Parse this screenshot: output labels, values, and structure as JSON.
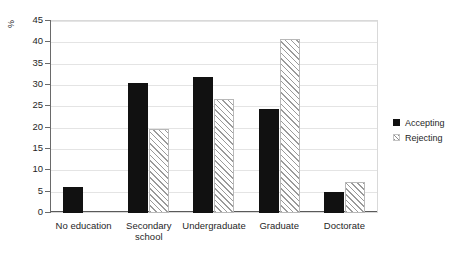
{
  "chart_data": {
    "type": "bar",
    "title": "",
    "subtitle": "",
    "xlabel": "",
    "ylabel": "%",
    "ylim": [
      0,
      45
    ],
    "ytick_step": 5,
    "yticks": [
      0,
      5,
      10,
      15,
      20,
      25,
      30,
      35,
      40,
      45
    ],
    "ytick_labels": [
      "0",
      "5",
      "10",
      "15",
      "20",
      "25",
      "30",
      "35",
      "40",
      "45"
    ],
    "grid": true,
    "grid_axis": "y",
    "legend_position": "right",
    "categories": [
      "No education",
      "Secondary school",
      "Undergraduate",
      "Graduate",
      "Doctorate"
    ],
    "category_label_lines": [
      [
        "No education"
      ],
      [
        "Secondary",
        "school"
      ],
      [
        "Undergraduate"
      ],
      [
        "Graduate"
      ],
      [
        "Doctorate"
      ]
    ],
    "series": [
      {
        "name": "Accepting",
        "fill": "solid",
        "color": "#111111",
        "values": [
          6.2,
          30.5,
          31.8,
          24.5,
          4.9
        ]
      },
      {
        "name": "Rejecting",
        "fill": "hatched",
        "color": "#9a9a9a",
        "values": [
          0,
          19.6,
          26.8,
          40.8,
          7.2
        ]
      }
    ]
  },
  "legend": {
    "items": [
      {
        "label": "Accepting",
        "swatch": "solid-black-square"
      },
      {
        "label": "Rejecting",
        "swatch": "hatched-square"
      }
    ]
  },
  "axes": {
    "y_title": "%"
  }
}
